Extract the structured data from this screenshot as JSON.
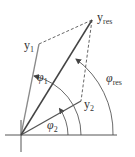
{
  "diagram": {
    "type": "phasor-vector-addition",
    "colors": {
      "axis": "#444444",
      "vector_y1": "#888888",
      "vector_y2": "#555555",
      "vector_res": "#444444",
      "dashed": "#555555",
      "arc": "#444444",
      "text": "#333333"
    },
    "vectors": [
      {
        "id": "y1",
        "label_main": "y",
        "label_sub": "1"
      },
      {
        "id": "y2",
        "label_main": "y",
        "label_sub": "2"
      },
      {
        "id": "yres",
        "label_main": "y",
        "label_sub": "res"
      }
    ],
    "angles": [
      {
        "id": "phi1",
        "label_main": "φ",
        "label_sub": "1"
      },
      {
        "id": "phi2",
        "label_main": "φ",
        "label_sub": "2"
      },
      {
        "id": "phires",
        "label_main": "φ",
        "label_sub": "res"
      }
    ]
  }
}
